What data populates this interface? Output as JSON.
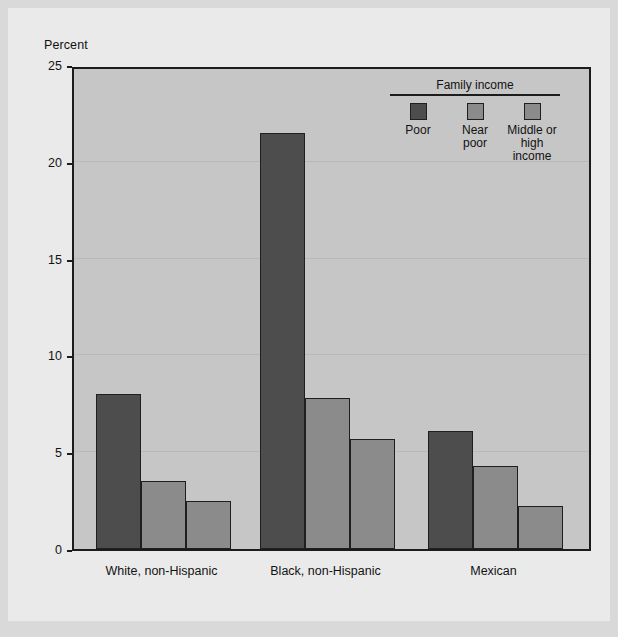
{
  "figure": {
    "background_color": "#eaeaea",
    "outer_color": "#d9d9d9",
    "plot_background": "#c6c6c6",
    "axis_color": "#1c1c1c"
  },
  "axis": {
    "ylabel": "Percent",
    "yticks": [
      "0",
      "5",
      "10",
      "15",
      "20",
      "25"
    ]
  },
  "legend": {
    "title": "Family income",
    "items": [
      {
        "label": "Poor",
        "color": "#4d4d4d"
      },
      {
        "label": "Near\npoor",
        "color": "#8b8b8b"
      },
      {
        "label": "Middle or\nhigh income",
        "color": "#8b8b8b"
      }
    ]
  },
  "chart_data": {
    "type": "bar",
    "title": "",
    "xlabel": "",
    "ylabel": "Percent",
    "ylim": [
      0,
      25
    ],
    "yticks": [
      0,
      5,
      10,
      15,
      20,
      25
    ],
    "grid": true,
    "legend_position": "upper-right-inside",
    "categories": [
      "White, non-Hispanic",
      "Black, non-Hispanic",
      "Mexican"
    ],
    "series": [
      {
        "name": "Poor",
        "color": "#4d4d4d",
        "values": [
          8.0,
          21.5,
          6.1
        ]
      },
      {
        "name": "Near poor",
        "color": "#8b8b8b",
        "values": [
          3.5,
          7.8,
          4.3
        ]
      },
      {
        "name": "Middle or high income",
        "color": "#8b8b8b",
        "values": [
          2.5,
          5.7,
          2.2
        ]
      }
    ]
  }
}
